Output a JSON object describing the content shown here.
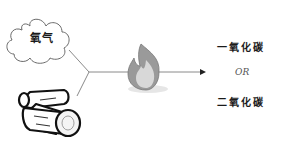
{
  "diagram": {
    "inputs": [
      {
        "name": "oxygen",
        "label": "氧气",
        "icon": "cloud-icon"
      },
      {
        "name": "wood",
        "label": "",
        "icon": "logs-icon"
      }
    ],
    "process": {
      "icon": "fire-icon"
    },
    "outputs": {
      "first": "一氧化碳",
      "separator": "OR",
      "second": "二氧化碳"
    },
    "colors": {
      "line": "#808080",
      "flame_outer": "#8a8a8a",
      "flame_inner": "#d8d8d8",
      "text": "#1a1a1a"
    }
  }
}
